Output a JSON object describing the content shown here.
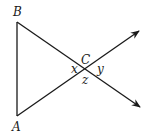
{
  "diagram": {
    "type": "geometry",
    "points": {
      "B": {
        "label": "B",
        "x": 17,
        "y": 22
      },
      "A": {
        "label": "A",
        "x": 17,
        "y": 116
      },
      "C": {
        "label": "C",
        "x": 86,
        "y": 69
      }
    },
    "rays": [
      {
        "from": "A",
        "through": "C",
        "arrow_end": {
          "x": 139,
          "y": 31
        }
      },
      {
        "from": "B",
        "through": "C",
        "arrow_end": {
          "x": 140,
          "y": 107
        }
      }
    ],
    "angle_labels": {
      "x": "x",
      "y": "y",
      "z": "z"
    },
    "colors": {
      "stroke": "#1a1a1a",
      "background": "#ffffff"
    }
  }
}
